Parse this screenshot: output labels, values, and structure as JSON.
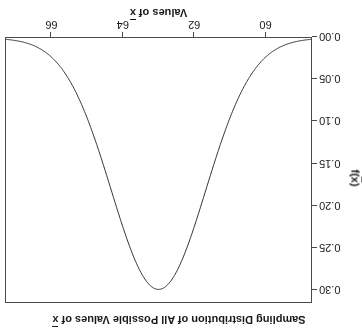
{
  "chart_data": {
    "type": "line",
    "xlabel": "Values of x̄",
    "ylabel": "f(x̄)",
    "xlim": [
      58.7,
      67.3
    ],
    "ylim": [
      0.0,
      0.315
    ],
    "grid": false,
    "legend": "none",
    "distribution": {
      "family": "normal",
      "mean": 63.0,
      "sd": 1.33,
      "peak_value": 0.3
    },
    "xticks": [
      {
        "value": 60,
        "label": "60"
      },
      {
        "value": 62,
        "label": "62"
      },
      {
        "value": 64,
        "label": "64"
      },
      {
        "value": 66,
        "label": "66"
      }
    ],
    "yticks": [
      {
        "value": 0.0,
        "label": "0.00"
      },
      {
        "value": 0.05,
        "label": "0.05"
      },
      {
        "value": 0.1,
        "label": "0.10"
      },
      {
        "value": 0.15,
        "label": "0.15"
      },
      {
        "value": 0.2,
        "label": "0.20"
      },
      {
        "value": 0.25,
        "label": "0.25"
      },
      {
        "value": 0.3,
        "label": "0.30"
      }
    ],
    "x": [
      58.7,
      59.0,
      59.3,
      59.6,
      59.9,
      60.2,
      60.5,
      60.8,
      61.1,
      61.4,
      61.7,
      62.0,
      62.3,
      62.6,
      62.9,
      63.0,
      63.1,
      63.4,
      63.7,
      64.0,
      64.3,
      64.6,
      64.9,
      65.2,
      65.5,
      65.8,
      66.1,
      66.4,
      66.7,
      67.0,
      67.3
    ],
    "values": [
      0.004,
      0.007,
      0.012,
      0.02,
      0.031,
      0.047,
      0.068,
      0.094,
      0.124,
      0.158,
      0.193,
      0.226,
      0.257,
      0.281,
      0.297,
      0.3,
      0.297,
      0.281,
      0.257,
      0.226,
      0.193,
      0.158,
      0.124,
      0.094,
      0.068,
      0.047,
      0.031,
      0.02,
      0.012,
      0.007,
      0.004
    ],
    "series_color": "#333333",
    "frame_color": "#4a4a4a",
    "background": "#ffffff"
  },
  "labels": {
    "title_prefix": "Sampling Distribution of All Possible Values of ",
    "title_var": "x",
    "xlabel_prefix": "Values of ",
    "xlabel_var": "x",
    "ylabel_prefix": "f(",
    "ylabel_var": "x",
    "ylabel_suffix": ")"
  }
}
